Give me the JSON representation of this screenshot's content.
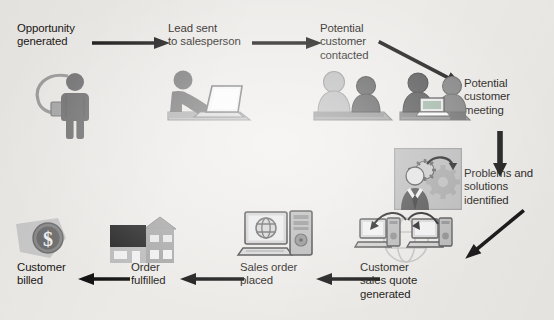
{
  "diagram": {
    "background_color": "#eceae7",
    "text_color": "#191613",
    "arrow_color": "#141414",
    "palette": {
      "dark_figure": "#6f6f6f",
      "darker_figure": "#4e4e4e",
      "light_figure": "#a9a9a9",
      "mid_gray": "#8d8d8d",
      "pale_gray": "#c8c8c8",
      "near_black": "#2b2b2b"
    },
    "steps": [
      {
        "id": "opportunity-generated",
        "label": "Opportunity\ngenerated",
        "icon": "person-with-lightbulb-icon",
        "order": 1
      },
      {
        "id": "lead-sent-to-salesperson",
        "label": "Lead sent\nto salesperson",
        "icon": "person-at-laptop-icon",
        "order": 2
      },
      {
        "id": "potential-customer-contacted",
        "label": "Potential\ncustomer\ncontacted",
        "icon": "two-people-talking-icon",
        "order": 3
      },
      {
        "id": "potential-customer-meeting",
        "label": "Potential\ncustomer\nmeeting",
        "icon": "meeting-with-laptop-icon",
        "order": 4
      },
      {
        "id": "problems-and-solutions-identified",
        "label": "Problems and\nsolutions\nidentified",
        "icon": "person-thinking-gears-icon",
        "order": 5
      },
      {
        "id": "customer-sales-quote-generated",
        "label": "Customer\nsales quote\ngenerated",
        "icon": "networked-computers-icon",
        "order": 6
      },
      {
        "id": "sales-order-placed",
        "label": "Sales order\nplaced",
        "icon": "desktop-computer-globe-icon",
        "order": 7
      },
      {
        "id": "order-fulfilled",
        "label": "Order\nfulfilled",
        "icon": "warehouse-building-icon",
        "order": 8
      },
      {
        "id": "customer-billed",
        "label": "Customer\nbilled",
        "icon": "dollar-coin-tag-icon",
        "order": 9
      }
    ],
    "connectors": [
      {
        "id": "arrow-1",
        "from": "opportunity-generated",
        "to": "lead-sent-to-salesperson",
        "direction": "right"
      },
      {
        "id": "arrow-2",
        "from": "lead-sent-to-salesperson",
        "to": "potential-customer-contacted",
        "direction": "right"
      },
      {
        "id": "arrow-3",
        "from": "potential-customer-contacted",
        "to": "potential-customer-meeting",
        "direction": "diagonal-down-right"
      },
      {
        "id": "arrow-4",
        "from": "potential-customer-meeting",
        "to": "problems-and-solutions-identified",
        "direction": "down"
      },
      {
        "id": "arrow-5",
        "from": "problems-and-solutions-identified",
        "to": "customer-sales-quote-generated",
        "direction": "diagonal-down-left"
      },
      {
        "id": "arrow-6",
        "from": "customer-sales-quote-generated",
        "to": "sales-order-placed",
        "direction": "left"
      },
      {
        "id": "arrow-7",
        "from": "sales-order-placed",
        "to": "order-fulfilled",
        "direction": "left"
      },
      {
        "id": "arrow-8",
        "from": "order-fulfilled",
        "to": "customer-billed",
        "direction": "left"
      }
    ]
  }
}
